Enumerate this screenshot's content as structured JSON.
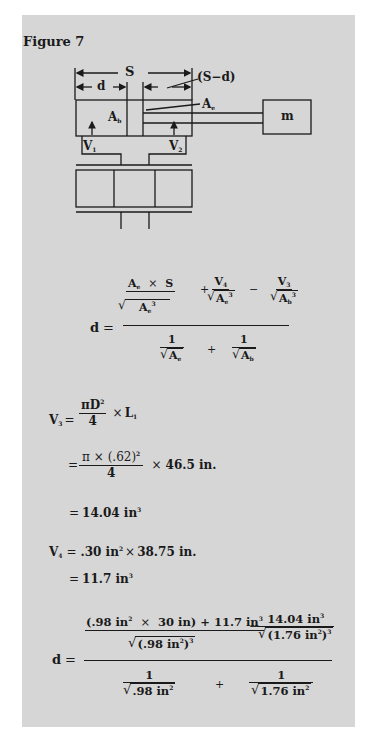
{
  "figure": {
    "title": "Figure 7"
  },
  "diagram": {
    "labels": {
      "stroke": "S",
      "displacement": "d",
      "remaining": "(S−d)",
      "rod_area": "A",
      "rod_area_sub": "e",
      "bore_area": "A",
      "bore_area_sub": "b",
      "mass": "m",
      "flow1": "V",
      "flow1_sub": "1",
      "flow2": "V",
      "flow2_sub": "2"
    }
  },
  "equations": {
    "general": {
      "lhs": "d",
      "eq": "=",
      "term1_num": "A",
      "term1_num_sub": "e",
      "term1_times": "×",
      "term1_S": "S",
      "term1_den": "A",
      "term1_den_sub": "e",
      "term1_den_sup": "3",
      "plus": "+",
      "term2_num": "V",
      "term2_num_sub": "4",
      "term2_den": "A",
      "term2_den_sub": "e",
      "term2_den_sup": "3",
      "minus": "−",
      "term3_num": "V",
      "term3_num_sub": "3",
      "term3_den": "A",
      "term3_den_sub": "b",
      "term3_den_sup": "3",
      "den1_num": "1",
      "den1_den": "A",
      "den1_den_sub": "e",
      "den_plus": "+",
      "den2_num": "1",
      "den2_den": "A",
      "den2_den_sub": "b"
    },
    "v3": {
      "lhs": "V",
      "lhs_sub": "3",
      "eq": "=",
      "num": "πD",
      "num_sup": "2",
      "den": "4",
      "times": "×",
      "L": "L",
      "L_sub": "1"
    },
    "v3_sub": {
      "eq": "=",
      "num": "π × (.62)",
      "num_sup": "2",
      "den": "4",
      "times": "×",
      "value": "46.5 in."
    },
    "v3_result": {
      "eq": "=",
      "value": "14.04 in",
      "sup": "3"
    },
    "v4": {
      "lhs": "V",
      "lhs_sub": "4",
      "eq": "=",
      "a": ".30 in",
      "a_sup": "2",
      "times": "×",
      "b": "38.75 in."
    },
    "v4_result": {
      "eq": "=",
      "value": "11.7 in",
      "sup": "3"
    },
    "numeric": {
      "lhs": "d",
      "eq": "=",
      "num1_a": "(.98 in",
      "num1_a_sup": "2",
      "num1_times": "×",
      "num1_b": "30 in)",
      "num1_plus": "+ 11.7 in",
      "num1_plus_sup": "3",
      "den1": "(.98 in",
      "den1_sup_inner": "2",
      "den1_close": ")",
      "den1_sup": "3",
      "minus": "−",
      "num2": "14.04 in",
      "num2_sup": "3",
      "den2": "(1.76 in",
      "den2_sup_inner": "2",
      "den2_close": ")",
      "den2_sup": "3",
      "d1_num": "1",
      "d1_den": ".98 in",
      "d1_den_sup": "2",
      "d_plus": "+",
      "d2_num": "1",
      "d2_den": "1.76 in",
      "d2_den_sup": "2"
    }
  }
}
